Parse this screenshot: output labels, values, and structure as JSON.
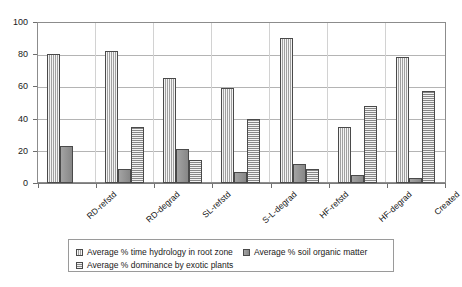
{
  "chart_data": {
    "type": "bar",
    "title": "",
    "xlabel": "",
    "ylabel": "",
    "ylim": [
      0,
      100
    ],
    "yticks": [
      0,
      20,
      40,
      60,
      80,
      100
    ],
    "grid": true,
    "legend_position": "bottom",
    "categories": [
      "RD-refstd",
      "RD-degrad",
      "SL-refstd",
      "S-L-degrad",
      "HF-refstd",
      "HF-degrad",
      "Created"
    ],
    "series": [
      {
        "name": "Average % time hydrology in root zone",
        "pattern": "vertical-stripes",
        "color": "#b5b5b5",
        "values": [
          80,
          82,
          65,
          59,
          90,
          35,
          78
        ]
      },
      {
        "name": "Average % soil organic matter",
        "pattern": "solid",
        "color": "#8f8f8f",
        "values": [
          23,
          9,
          21,
          7,
          12,
          5,
          3
        ]
      },
      {
        "name": "Average % dominance by exotic plants",
        "pattern": "horizontal-stripes",
        "color": "#acacac",
        "values": [
          0,
          35,
          14,
          40,
          9,
          48,
          57
        ]
      }
    ]
  },
  "axis": {
    "y_tick_labels": [
      "0",
      "20",
      "40",
      "60",
      "80",
      "100"
    ]
  },
  "legend": {
    "entries": [
      "Average % time hydrology in root zone",
      "Average % soil organic matter",
      "Average % dominance by exotic plants"
    ]
  }
}
